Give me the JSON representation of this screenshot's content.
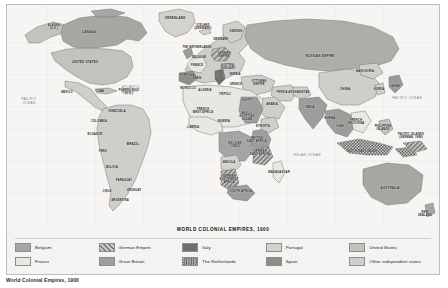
{
  "map": {
    "title": "WORLD COLONIAL EMPIRES, 1900",
    "caption": "World Colonial Empires, 1900",
    "oceans": [
      {
        "name": "PACIFIC\nOCEAN",
        "x": 22,
        "y": 97
      },
      {
        "name": "ATLANTIC\nOCEAN",
        "x": 124,
        "y": 85
      },
      {
        "name": "INDIAN OCEAN",
        "x": 300,
        "y": 151
      },
      {
        "name": "PACIFIC OCEAN",
        "x": 400,
        "y": 94
      }
    ],
    "regions": [
      {
        "name": "ALASKA\n(U.S.)",
        "x": 47,
        "y": 22,
        "size": "sm"
      },
      {
        "name": "CANADA",
        "x": 82,
        "y": 28
      },
      {
        "name": "UNITED STATES",
        "x": 78,
        "y": 58
      },
      {
        "name": "MEXICO",
        "x": 60,
        "y": 88
      },
      {
        "name": "CUBA",
        "x": 93,
        "y": 87,
        "size": "sm"
      },
      {
        "name": "PUERTO RICO\n(U.S.)",
        "x": 122,
        "y": 87,
        "size": "sm"
      },
      {
        "name": "VENEZUELA",
        "x": 110,
        "y": 107,
        "size": "sm"
      },
      {
        "name": "COLOMBIA",
        "x": 92,
        "y": 117,
        "size": "sm"
      },
      {
        "name": "ECUADOR",
        "x": 88,
        "y": 130,
        "size": "sm"
      },
      {
        "name": "PERU",
        "x": 96,
        "y": 147,
        "size": "sm"
      },
      {
        "name": "BRAZIL",
        "x": 126,
        "y": 140
      },
      {
        "name": "BOLIVIA",
        "x": 105,
        "y": 163,
        "size": "sm"
      },
      {
        "name": "PARAGUAY",
        "x": 117,
        "y": 176,
        "size": "sm"
      },
      {
        "name": "CHILE",
        "x": 100,
        "y": 187,
        "size": "sm"
      },
      {
        "name": "ARGENTINA",
        "x": 113,
        "y": 196,
        "size": "sm"
      },
      {
        "name": "URUGUAY",
        "x": 127,
        "y": 186,
        "size": "sm"
      },
      {
        "name": "GREENLAND",
        "x": 168,
        "y": 14
      },
      {
        "name": "ICELAND\n(DENMARK)",
        "x": 196,
        "y": 22,
        "size": "sm"
      },
      {
        "name": "THE NETHERLANDS",
        "x": 190,
        "y": 43,
        "size": "sm"
      },
      {
        "name": "DENMARK",
        "x": 214,
        "y": 35,
        "size": "sm"
      },
      {
        "name": "SWEDEN",
        "x": 229,
        "y": 27,
        "size": "sm"
      },
      {
        "name": "BELGIUM",
        "x": 192,
        "y": 53,
        "size": "sm"
      },
      {
        "name": "FRANCE",
        "x": 190,
        "y": 61,
        "size": "sm"
      },
      {
        "name": "GERMAN\nEMPIRE",
        "x": 217,
        "y": 50,
        "size": "sm"
      },
      {
        "name": "AUSTRIA-\nHUNGARY",
        "x": 221,
        "y": 62,
        "size": "sm"
      },
      {
        "name": "PORTUGAL",
        "x": 181,
        "y": 71,
        "size": "sm"
      },
      {
        "name": "SPAIN",
        "x": 190,
        "y": 74,
        "size": "sm"
      },
      {
        "name": "ITALY",
        "x": 214,
        "y": 72,
        "size": "sm"
      },
      {
        "name": "SERBIA",
        "x": 228,
        "y": 70,
        "size": "sm"
      },
      {
        "name": "GREECE",
        "x": 229,
        "y": 80,
        "size": "sm"
      },
      {
        "name": "OTTOMAN\nEMPIRE",
        "x": 252,
        "y": 78,
        "size": "sm"
      },
      {
        "name": "MOROCCO",
        "x": 181,
        "y": 84,
        "size": "sm"
      },
      {
        "name": "ALGERIA",
        "x": 198,
        "y": 86,
        "size": "sm"
      },
      {
        "name": "TRIPOLI",
        "x": 218,
        "y": 90,
        "size": "sm"
      },
      {
        "name": "EGYPT",
        "x": 240,
        "y": 96,
        "size": "sm"
      },
      {
        "name": "ARABIA",
        "x": 265,
        "y": 100,
        "size": "sm"
      },
      {
        "name": "PERSIA",
        "x": 275,
        "y": 88,
        "size": "sm"
      },
      {
        "name": "AFGHANISTAN",
        "x": 292,
        "y": 88,
        "size": "sm"
      },
      {
        "name": "INDIA",
        "x": 303,
        "y": 103
      },
      {
        "name": "FRENCH\nWEST AFRICA",
        "x": 196,
        "y": 106,
        "size": "sm"
      },
      {
        "name": "ANGLO-\nEGYPTIAN\nSUDAN",
        "x": 240,
        "y": 112,
        "size": "sm"
      },
      {
        "name": "NIGERIA",
        "x": 217,
        "y": 117,
        "size": "sm"
      },
      {
        "name": "LIBERIA",
        "x": 186,
        "y": 123,
        "size": "sm"
      },
      {
        "name": "ETHIOPIA",
        "x": 256,
        "y": 122,
        "size": "sm"
      },
      {
        "name": "BELGIAN\nCONGO",
        "x": 228,
        "y": 140,
        "size": "sm"
      },
      {
        "name": "BRITISH\nEAST AFRICA",
        "x": 250,
        "y": 135,
        "size": "sm"
      },
      {
        "name": "GERMAN\nEAST AFRICA",
        "x": 253,
        "y": 148,
        "size": "sm"
      },
      {
        "name": "ANGOLA",
        "x": 222,
        "y": 158,
        "size": "sm"
      },
      {
        "name": "GERMAN\nSOUTHWEST\nAFRICA",
        "x": 222,
        "y": 175,
        "size": "sm"
      },
      {
        "name": "SOUTH AFRICA",
        "x": 234,
        "y": 187,
        "size": "sm"
      },
      {
        "name": "MADAGASCAR",
        "x": 272,
        "y": 168,
        "size": "sm"
      },
      {
        "name": "RUSSIAN EMPIRE",
        "x": 313,
        "y": 52
      },
      {
        "name": "CHINA",
        "x": 338,
        "y": 85
      },
      {
        "name": "MANCHURIA",
        "x": 358,
        "y": 67,
        "size": "sm"
      },
      {
        "name": "KOREA",
        "x": 372,
        "y": 85,
        "size": "sm"
      },
      {
        "name": "JAPAN",
        "x": 388,
        "y": 82,
        "size": "sm"
      },
      {
        "name": "BURMA",
        "x": 323,
        "y": 114,
        "size": "sm"
      },
      {
        "name": "SIAM",
        "x": 333,
        "y": 122,
        "size": "sm"
      },
      {
        "name": "FRENCH\nINDOCHINA",
        "x": 349,
        "y": 117,
        "size": "sm"
      },
      {
        "name": "PHILIPPINE\nISLANDS",
        "x": 376,
        "y": 123,
        "size": "sm"
      },
      {
        "name": "DUTCH EAST INDIES",
        "x": 355,
        "y": 147,
        "size": "sm"
      },
      {
        "name": "PACIFIC ISLANDS\n(GERMAN, 1899)",
        "x": 404,
        "y": 131,
        "size": "sm"
      },
      {
        "name": "AUSTRALIA",
        "x": 383,
        "y": 184
      },
      {
        "name": "NEW\nZEALAND",
        "x": 418,
        "y": 209,
        "size": "sm"
      }
    ]
  },
  "legend": {
    "items": [
      {
        "label": "Belgium",
        "pattern": "solid",
        "color": "#a5a5a5"
      },
      {
        "label": "German Empire",
        "pattern": "diagonal",
        "color": "#9a9a9a"
      },
      {
        "label": "Italy",
        "pattern": "solid",
        "color": "#6e6e6e"
      },
      {
        "label": "Portugal",
        "pattern": "solid",
        "color": "#d4d2cd"
      },
      {
        "label": "United States",
        "pattern": "solid",
        "color": "#c3c2bd"
      },
      {
        "label": "France",
        "pattern": "solid",
        "color": "#e8e7e2"
      },
      {
        "label": "Great Britain",
        "pattern": "solid",
        "color": "#9d9d9b"
      },
      {
        "label": "The Netherlands",
        "pattern": "crosshatch",
        "color": "#6b6b6b"
      },
      {
        "label": "Spain",
        "pattern": "solid",
        "color": "#8e8d8a"
      },
      {
        "label": "Other independent states",
        "pattern": "solid",
        "color": "#cfcecb"
      }
    ]
  }
}
